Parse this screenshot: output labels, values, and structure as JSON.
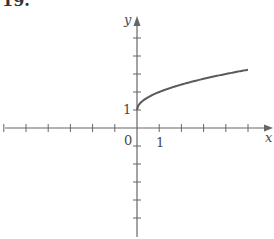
{
  "problem_label": "19.",
  "chart_data": {
    "type": "line",
    "title": "",
    "function": "y = 1 + sqrt(x)",
    "xlabel": "x",
    "ylabel": "y",
    "x_tick_labels": [
      {
        "value": 0,
        "label": "0"
      },
      {
        "value": 1,
        "label": "1"
      }
    ],
    "y_tick_labels": [
      {
        "value": 1,
        "label": "1"
      }
    ],
    "x_ticks": [
      -6,
      -5,
      -4,
      -3,
      -2,
      -1,
      1,
      2,
      3,
      4,
      5
    ],
    "y_ticks": [
      -6,
      -5,
      -4,
      -3,
      -2,
      -1,
      1,
      2,
      3,
      4,
      5
    ],
    "xlim": [
      -6,
      6
    ],
    "ylim": [
      -6,
      6
    ],
    "grid": false,
    "series": [
      {
        "name": "curve",
        "x": [
          0,
          0.05,
          0.25,
          0.5,
          1,
          1.5,
          2,
          2.5,
          3,
          3.5,
          4,
          4.5,
          5
        ],
        "y": [
          1,
          1.224,
          1.5,
          1.707,
          2,
          2.225,
          2.414,
          2.581,
          2.732,
          2.871,
          3,
          3.121,
          3.236
        ]
      }
    ],
    "color": "#5a5a5a"
  },
  "labels": {
    "origin": "0",
    "x_one": "1",
    "y_one": "1",
    "x_axis": "x",
    "y_axis": "y"
  }
}
